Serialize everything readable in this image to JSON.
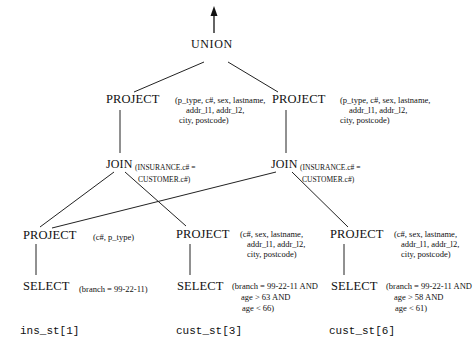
{
  "diagram": {
    "type": "query-tree",
    "root": {
      "id": "union",
      "operator": "UNION"
    },
    "nodes": {
      "project_top_left": {
        "operator": "PROJECT",
        "args_line1": "(p_type, c#, sex, lastname,",
        "args_line2": "addr_l1, addr_l2,",
        "args_line3": "city, postcode)"
      },
      "project_top_right": {
        "operator": "PROJECT",
        "args_line1": "(p_type, c#, sex, lastname,",
        "args_line2": "addr_l1, addr_l2,",
        "args_line3": "city, postcode)"
      },
      "join_left": {
        "operator": "JOIN",
        "args_line1": "(INSURANCE.c# =",
        "args_line2": "CUSTOMER.c#)"
      },
      "join_right": {
        "operator": "JOIN",
        "args_line1": "(INSURANCE.c# =",
        "args_line2": "CUSTOMER.c#)"
      },
      "project_ins": {
        "operator": "PROJECT",
        "args_line1": "(c#, p_type)"
      },
      "project_cust3": {
        "operator": "PROJECT",
        "args_line1": "(c#, sex, lastname,",
        "args_line2": "addr_l1, addr_l2,",
        "args_line3": "city, postcode)"
      },
      "project_cust6": {
        "operator": "PROJECT",
        "args_line1": "(c#, sex, lastname,",
        "args_line2": "addr_l1, addr_l2,",
        "args_line3": "city, postcode)"
      },
      "select_ins": {
        "operator": "SELECT",
        "args_line1": "(branch = 99-22-11)"
      },
      "select_cust3": {
        "operator": "SELECT",
        "args_line1": "(branch = 99-22-11 AND",
        "args_line2": "age > 63 AND",
        "args_line3": "age < 66)"
      },
      "select_cust6": {
        "operator": "SELECT",
        "args_line1": "(branch = 99-22-11 AND",
        "args_line2": "age > 58 AND",
        "args_line3": "age < 61)"
      }
    },
    "fragments": {
      "ins": "ins_st[1]",
      "cust3": "cust_st[3]",
      "cust6": "cust_st[6]"
    },
    "edges": [
      [
        "union",
        "output-arrow"
      ],
      [
        "union",
        "project_top_left"
      ],
      [
        "union",
        "project_top_right"
      ],
      [
        "project_top_left",
        "join_left"
      ],
      [
        "project_top_right",
        "join_right"
      ],
      [
        "join_left",
        "project_ins"
      ],
      [
        "join_left",
        "project_cust3"
      ],
      [
        "join_right",
        "project_ins"
      ],
      [
        "join_right",
        "project_cust6"
      ],
      [
        "project_ins",
        "select_ins"
      ],
      [
        "project_cust3",
        "select_cust3"
      ],
      [
        "project_cust6",
        "select_cust6"
      ]
    ]
  }
}
